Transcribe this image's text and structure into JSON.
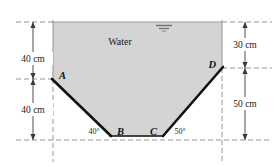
{
  "figure": {
    "fluid_label": "Water",
    "colors": {
      "fluid_fill": "#d4d4d4",
      "wall_stroke": "#111111",
      "guide_stroke": "#8a8a8a",
      "boundary_stroke": "#9a9a9a",
      "text": "#1a1a1a",
      "background": "#ffffff"
    },
    "points": [
      {
        "id": "A",
        "label": "A"
      },
      {
        "id": "B",
        "label": "B"
      },
      {
        "id": "C",
        "label": "C"
      },
      {
        "id": "D",
        "label": "D"
      }
    ],
    "angles": [
      {
        "at": "B",
        "label": "40°"
      },
      {
        "at": "C",
        "label": "50°"
      }
    ],
    "dimensions": [
      {
        "id": "left-upper",
        "label": "40 cm",
        "side": "left"
      },
      {
        "id": "left-lower",
        "label": "40 cm",
        "side": "left"
      },
      {
        "id": "right-upper",
        "label": "30 cm",
        "side": "right"
      },
      {
        "id": "right-lower",
        "label": "50 cm",
        "side": "right"
      }
    ],
    "surface_marker": "free-surface-symbol"
  }
}
